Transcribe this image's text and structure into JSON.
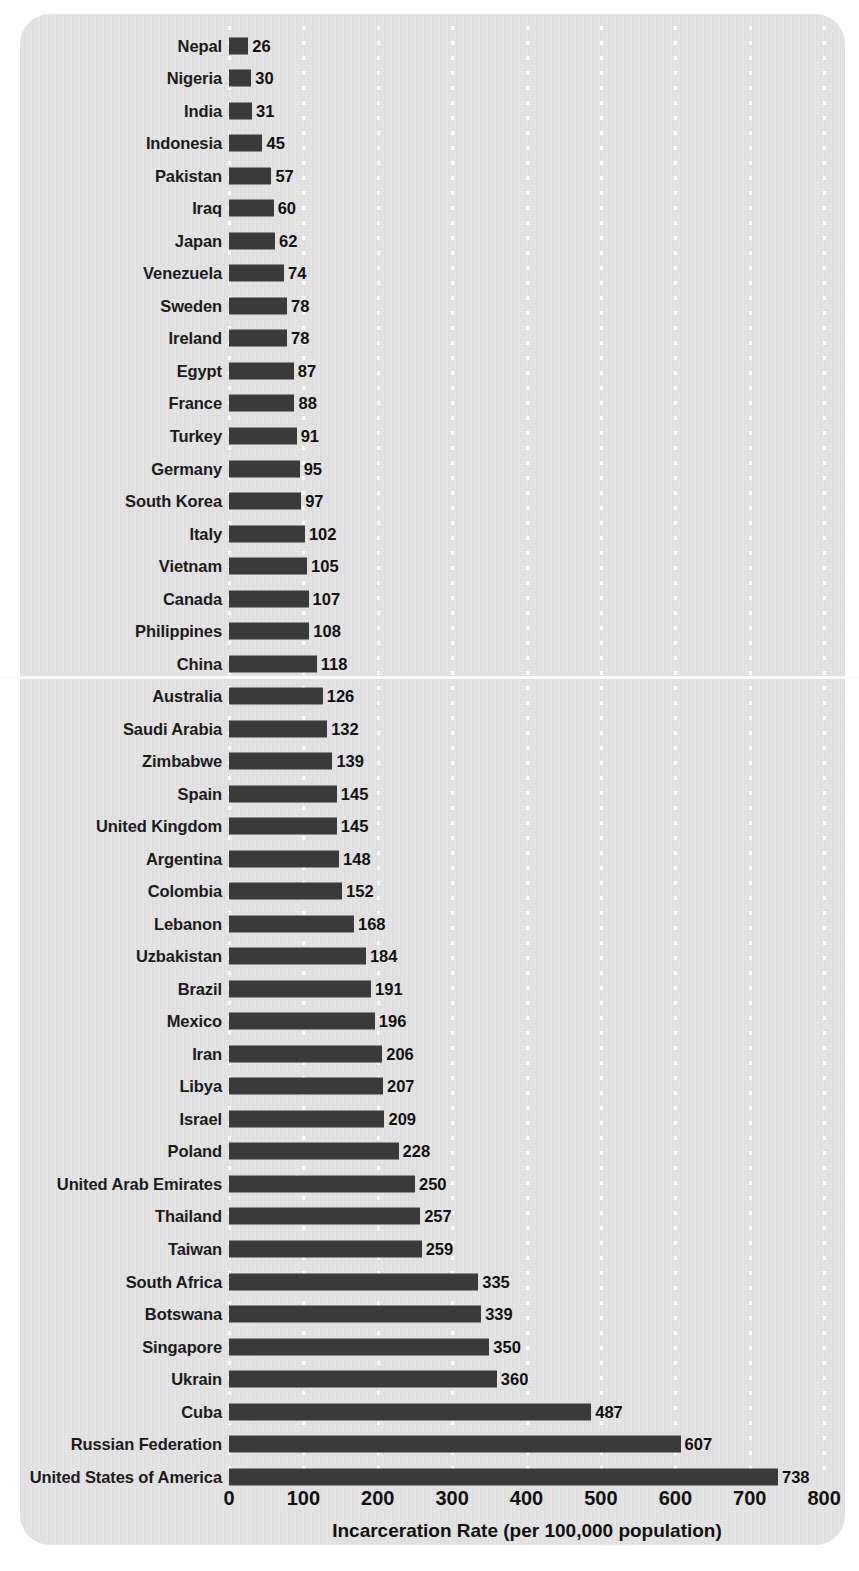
{
  "chart_data": {
    "type": "bar",
    "orientation": "horizontal",
    "title": "",
    "xlabel": "Incarceration Rate (per 100,000 population)",
    "ylabel": "",
    "xlim": [
      0,
      800
    ],
    "xticks": [
      0,
      100,
      200,
      300,
      400,
      500,
      600,
      700,
      800
    ],
    "grid": "vertical-dotted-white",
    "legend": "none",
    "bar_color": "#3a3a3a",
    "background_color": "#e2e2e2",
    "value_labels": true,
    "categories": [
      "Nepal",
      "Nigeria",
      "India",
      "Indonesia",
      "Pakistan",
      "Iraq",
      "Japan",
      "Venezuela",
      "Sweden",
      "Ireland",
      "Egypt",
      "France",
      "Turkey",
      "Germany",
      "South Korea",
      "Italy",
      "Vietnam",
      "Canada",
      "Philippines",
      "China",
      "Australia",
      "Saudi Arabia",
      "Zimbabwe",
      "Spain",
      "United Kingdom",
      "Argentina",
      "Colombia",
      "Lebanon",
      "Uzbakistan",
      "Brazil",
      "Mexico",
      "Iran",
      "Libya",
      "Israel",
      "Poland",
      "United Arab Emirates",
      "Thailand",
      "Taiwan",
      "South Africa",
      "Botswana",
      "Singapore",
      "Ukrain",
      "Cuba",
      "Russian Federation",
      "United States of America"
    ],
    "values": [
      26,
      30,
      31,
      45,
      57,
      60,
      62,
      74,
      78,
      78,
      87,
      88,
      91,
      95,
      97,
      102,
      105,
      107,
      108,
      118,
      126,
      132,
      139,
      145,
      145,
      148,
      152,
      168,
      184,
      191,
      196,
      206,
      207,
      209,
      228,
      250,
      257,
      259,
      335,
      339,
      350,
      360,
      487,
      607,
      738
    ]
  },
  "axis": {
    "title": "Incarceration Rate (per 100,000 population)",
    "ticks": [
      "0",
      "100",
      "200",
      "300",
      "400",
      "500",
      "600",
      "700",
      "800"
    ]
  }
}
